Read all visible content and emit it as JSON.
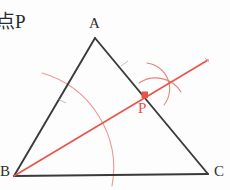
{
  "caption": {
    "text": "点P"
  },
  "colors": {
    "ink": "#3a3a3a",
    "construction": "#e8766c",
    "accent": "#e8544a",
    "page": "#fdfdfd"
  },
  "figure": {
    "type": "geometry-construction",
    "vertices": [
      {
        "name": "A",
        "label": "A",
        "x": 95,
        "y": 38
      },
      {
        "name": "B",
        "label": "B",
        "x": 14,
        "y": 176
      },
      {
        "name": "C",
        "label": "C",
        "x": 208,
        "y": 174
      }
    ],
    "point": {
      "name": "P",
      "label": "P",
      "x": 145,
      "y": 95
    },
    "sides": [
      {
        "name": "AB",
        "from": "A",
        "to": "B"
      },
      {
        "name": "AC",
        "from": "A",
        "to": "C"
      },
      {
        "name": "BC",
        "from": "B",
        "to": "C"
      }
    ],
    "ray": {
      "name": "bisector-ray",
      "from": {
        "x": 14,
        "y": 176
      },
      "to": {
        "x": 208,
        "y": 60
      }
    },
    "arcs": [
      {
        "name": "compass-arc-from-B",
        "center": "B",
        "radius": 98
      },
      {
        "name": "compass-arc-upper",
        "kind": "cross-arc"
      },
      {
        "name": "compass-arc-lower",
        "kind": "cross-arc"
      }
    ],
    "tick_marks": [
      {
        "name": "tick-on-AB",
        "x": 62,
        "y": 85
      },
      {
        "name": "tick-on-AC",
        "x": 125,
        "y": 78
      }
    ]
  }
}
